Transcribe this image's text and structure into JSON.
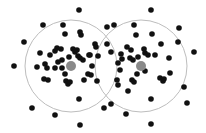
{
  "diagram": {
    "colors": {
      "point": "#111111",
      "center": "#8a8a8a",
      "circle": "#bdbdbd",
      "background": "#ffffff"
    },
    "circles": [
      {
        "cx": 71,
        "cy": 66,
        "r": 46
      },
      {
        "cx": 141,
        "cy": 66,
        "r": 46
      }
    ],
    "centers": [
      {
        "x": 71,
        "y": 66,
        "r": 5
      },
      {
        "x": 141,
        "y": 66,
        "r": 5
      }
    ],
    "points": [
      [
        79,
        10
      ],
      [
        43,
        25
      ],
      [
        63,
        25
      ],
      [
        81,
        35
      ],
      [
        24,
        42
      ],
      [
        65,
        34
      ],
      [
        80,
        32
      ],
      [
        95,
        44
      ],
      [
        96,
        47
      ],
      [
        57,
        48
      ],
      [
        40,
        53
      ],
      [
        61,
        49
      ],
      [
        55,
        51
      ],
      [
        73,
        49
      ],
      [
        77,
        50
      ],
      [
        75,
        52
      ],
      [
        69,
        57
      ],
      [
        90,
        55
      ],
      [
        98,
        56
      ],
      [
        50,
        55
      ],
      [
        62,
        60
      ],
      [
        58,
        62
      ],
      [
        78,
        56
      ],
      [
        80,
        58
      ],
      [
        89,
        55
      ],
      [
        14,
        66
      ],
      [
        37,
        67
      ],
      [
        45,
        64
      ],
      [
        47,
        68
      ],
      [
        55,
        68
      ],
      [
        62,
        68
      ],
      [
        65,
        74
      ],
      [
        83,
        60
      ],
      [
        88,
        74
      ],
      [
        91,
        75
      ],
      [
        84,
        80
      ],
      [
        97,
        81
      ],
      [
        92,
        66
      ],
      [
        44,
        79
      ],
      [
        48,
        80
      ],
      [
        66,
        81
      ],
      [
        68,
        84
      ],
      [
        70,
        82
      ],
      [
        79,
        99
      ],
      [
        32,
        108
      ],
      [
        55,
        115
      ],
      [
        80,
        125
      ],
      [
        151,
        10
      ],
      [
        107,
        27
      ],
      [
        114,
        25
      ],
      [
        134,
        25
      ],
      [
        136,
        35
      ],
      [
        152,
        34
      ],
      [
        179,
        28
      ],
      [
        107,
        44
      ],
      [
        111,
        52
      ],
      [
        127,
        47
      ],
      [
        131,
        50
      ],
      [
        145,
        53
      ],
      [
        144,
        49
      ],
      [
        148,
        55
      ],
      [
        121,
        54
      ],
      [
        122,
        59
      ],
      [
        118,
        63
      ],
      [
        130,
        58
      ],
      [
        133,
        60
      ],
      [
        138,
        57
      ],
      [
        155,
        55
      ],
      [
        161,
        44
      ],
      [
        178,
        42
      ],
      [
        194,
        52
      ],
      [
        169,
        58
      ],
      [
        170,
        73
      ],
      [
        160,
        78
      ],
      [
        163,
        81
      ],
      [
        164,
        79
      ],
      [
        145,
        71
      ],
      [
        137,
        74
      ],
      [
        132,
        80
      ],
      [
        134,
        82
      ],
      [
        120,
        70
      ],
      [
        117,
        80
      ],
      [
        118,
        85
      ],
      [
        128,
        91
      ],
      [
        151,
        99
      ],
      [
        111,
        104
      ],
      [
        104,
        108
      ],
      [
        126,
        114
      ],
      [
        184,
        87
      ],
      [
        187,
        103
      ],
      [
        151,
        124
      ]
    ]
  }
}
